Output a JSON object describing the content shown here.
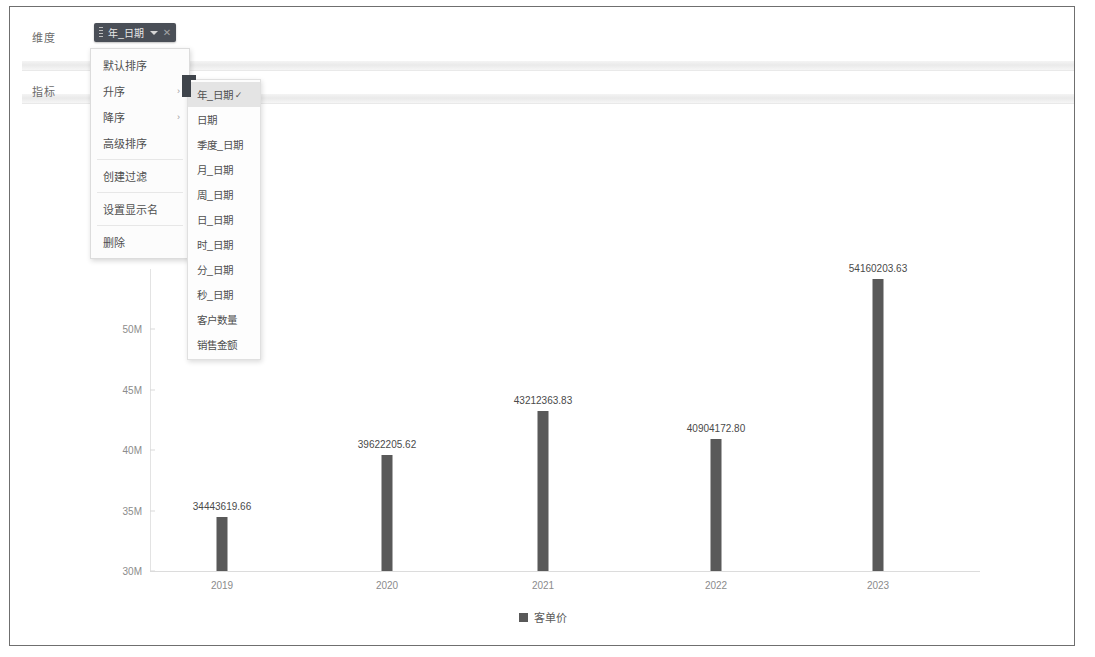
{
  "shelves": {
    "dimension_label": "维度",
    "metric_label": "指标",
    "chip": {
      "text": "年_日期",
      "caret_icon": "chevron-down-icon",
      "close_icon": "close-icon",
      "grip_icon": "drag-grip-icon"
    }
  },
  "context_menu": {
    "items": [
      {
        "label": "默认排序",
        "has_submenu": false,
        "arrow": ""
      },
      {
        "label": "升序",
        "has_submenu": true,
        "arrow": "›"
      },
      {
        "label": "降序",
        "has_submenu": true,
        "arrow": "›"
      },
      {
        "label": "高级排序",
        "has_submenu": false,
        "arrow": ""
      },
      {
        "label": "创建过滤",
        "has_submenu": false,
        "arrow": ""
      },
      {
        "label": "设置显示名",
        "has_submenu": false,
        "arrow": ""
      },
      {
        "label": "删除",
        "has_submenu": false,
        "arrow": ""
      }
    ]
  },
  "submenu": {
    "items": [
      {
        "label": "年_日期",
        "selected": true,
        "check": "✓"
      },
      {
        "label": "日期",
        "selected": false,
        "check": ""
      },
      {
        "label": "季度_日期",
        "selected": false,
        "check": ""
      },
      {
        "label": "月_日期",
        "selected": false,
        "check": ""
      },
      {
        "label": "周_日期",
        "selected": false,
        "check": ""
      },
      {
        "label": "日_日期",
        "selected": false,
        "check": ""
      },
      {
        "label": "时_日期",
        "selected": false,
        "check": ""
      },
      {
        "label": "分_日期",
        "selected": false,
        "check": ""
      },
      {
        "label": "秒_日期",
        "selected": false,
        "check": ""
      },
      {
        "label": "客户数量",
        "selected": false,
        "check": ""
      },
      {
        "label": "销售金额",
        "selected": false,
        "check": ""
      }
    ]
  },
  "chart_data": {
    "type": "bar",
    "title": "",
    "xlabel": "",
    "ylabel": "",
    "categories": [
      "2019",
      "2020",
      "2021",
      "2022",
      "2023"
    ],
    "values": [
      34443619.66,
      39622205.62,
      43212363.83,
      40904172.8,
      54160203.63
    ],
    "value_labels": [
      "34443619.66",
      "39622205.62",
      "43212363.83",
      "40904172.80",
      "54160203.63"
    ],
    "ylim": [
      30000000,
      55000000
    ],
    "yticks": [
      30000000,
      35000000,
      40000000,
      45000000,
      50000000
    ],
    "ytick_labels": [
      "30M",
      "35M",
      "40M",
      "45M",
      "50M"
    ],
    "grid": false,
    "legend_position": "bottom",
    "series": [
      {
        "name": "客单价",
        "color": "#595959",
        "values": [
          34443619.66,
          39622205.62,
          43212363.83,
          40904172.8,
          54160203.63
        ]
      }
    ]
  }
}
